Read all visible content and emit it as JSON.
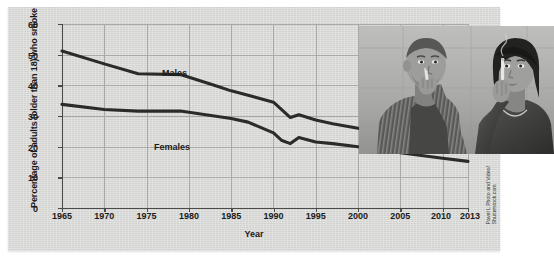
{
  "chart_data": {
    "type": "line",
    "title": "",
    "xlabel": "Year",
    "ylabel": "Percentage of adults (older than 18) who smoke",
    "xlim": [
      1965,
      2013
    ],
    "ylim": [
      0,
      60
    ],
    "grid": true,
    "legend_position": "inline-labels",
    "xticks": [
      "1965",
      "1970",
      "1975",
      "1980",
      "1985",
      "1990",
      "1995",
      "2000",
      "2005",
      "2010",
      "2013"
    ],
    "xtick_values": [
      1965,
      1970,
      1975,
      1980,
      1985,
      1990,
      1995,
      2000,
      2005,
      2010,
      2013
    ],
    "yticks": [
      "0",
      "10",
      "20",
      "30",
      "40",
      "50",
      "60"
    ],
    "ytick_values": [
      0,
      10,
      20,
      30,
      40,
      50,
      60
    ],
    "x": [
      1965,
      1970,
      1974,
      1979,
      1983,
      1985,
      1987,
      1990,
      1991,
      1992,
      1993,
      1995,
      1997,
      2000,
      2005,
      2010,
      2013
    ],
    "series": [
      {
        "name": "Males",
        "color": "#2b2b2b",
        "values": [
          51.2,
          47.0,
          43.8,
          43.5,
          40.0,
          38.2,
          36.8,
          34.5,
          32.0,
          29.5,
          30.4,
          28.7,
          27.5,
          26.0,
          23.5,
          21.5,
          19.4
        ]
      },
      {
        "name": "Females",
        "color": "#2b2b2b",
        "values": [
          33.8,
          32.1,
          31.6,
          31.6,
          30.0,
          29.2,
          28.0,
          24.5,
          22.0,
          21.0,
          23.0,
          21.5,
          21.0,
          20.0,
          18.0,
          16.2,
          15.2
        ]
      }
    ],
    "annotations": [
      {
        "text": "Males",
        "x": 1977,
        "y": 46
      },
      {
        "text": "Females",
        "x": 1976,
        "y": 27
      }
    ]
  },
  "axis": {
    "ylabel": "Percentage of adults (older than 18) who smoke",
    "xlabel": "Year"
  },
  "series_labels": {
    "males": "Males",
    "females": "Females"
  },
  "photo": {
    "alt": "man and woman smoking cigarettes",
    "credit": "Pavel L Photo and Video/\nShutterstock.com"
  }
}
